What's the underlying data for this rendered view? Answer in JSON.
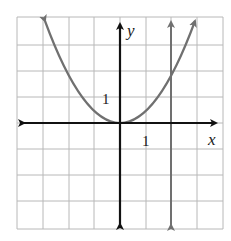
{
  "graph": {
    "type": "coordinate-plane",
    "x_axis_label": "x",
    "y_axis_label": "y",
    "x_tick_label": "1",
    "y_tick_label": "1",
    "grid": {
      "x_min": -4,
      "x_max": 4,
      "y_min": -4.5,
      "y_max": 4.5,
      "step": 1
    },
    "curves": [
      {
        "name": "parabola",
        "equation": "y = 0.5x^2",
        "color": "#707070"
      },
      {
        "name": "vertical-line",
        "equation": "x = 2",
        "color": "#707070"
      }
    ],
    "colors": {
      "grid": "#b0b0b0",
      "axis": "#111111",
      "curve": "#707070"
    }
  }
}
